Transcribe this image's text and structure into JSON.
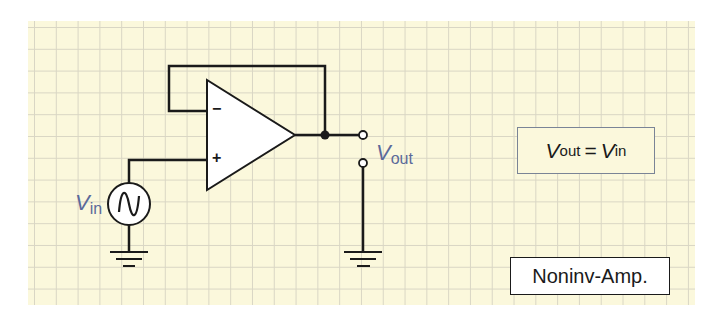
{
  "diagram": {
    "title": "Noninv-Amp.",
    "formula": {
      "lhs_symbol": "V",
      "lhs_sub": "out",
      "equals": "=",
      "rhs_symbol": "V",
      "rhs_sub": "in"
    },
    "labels": {
      "vin_symbol": "V",
      "vin_sub": "in",
      "vout_symbol": "V",
      "vout_sub": "out",
      "minus": "−",
      "plus": "+"
    },
    "components": [
      "op-amp (voltage follower)",
      "AC voltage source",
      "ground",
      "ground",
      "output terminals"
    ],
    "colors": {
      "paper": "#fbf8dc",
      "grid": "#d9d6c4",
      "wire": "#1a1a1a",
      "label": "#5b6a9a",
      "formula_border": "#7a8496"
    }
  }
}
